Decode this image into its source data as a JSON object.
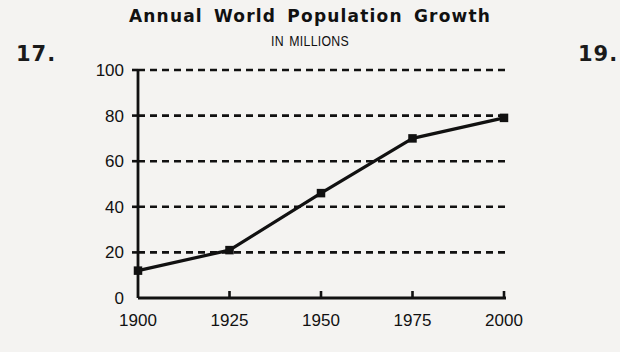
{
  "page": {
    "left_marker": "17.",
    "right_marker": "19."
  },
  "chart_data": {
    "type": "line",
    "title": "Annual World Population Growth",
    "subtitle": "IN MILLIONS",
    "xlabel": "",
    "ylabel": "",
    "x": [
      1900,
      1925,
      1950,
      1975,
      2000
    ],
    "categories": [
      "1900",
      "1925",
      "1950",
      "1975",
      "2000"
    ],
    "values": [
      12,
      21,
      46,
      70,
      79
    ],
    "ylim": [
      0,
      100
    ],
    "xlim": [
      1900,
      2000
    ],
    "yticks": [
      0,
      20,
      40,
      60,
      80,
      100
    ],
    "ytick_labels": [
      "0",
      "20",
      "40",
      "60",
      "80",
      "100"
    ],
    "xticks": [
      1900,
      1925,
      1950,
      1975,
      2000
    ],
    "xtick_labels": [
      "1900",
      "1925",
      "1950",
      "1975",
      "2000"
    ],
    "grid": "horizontal-dashed",
    "legend": "none",
    "marker": "square",
    "line_color": "#111111",
    "grid_color": "#111111",
    "background_color": "#f4f3f1"
  }
}
